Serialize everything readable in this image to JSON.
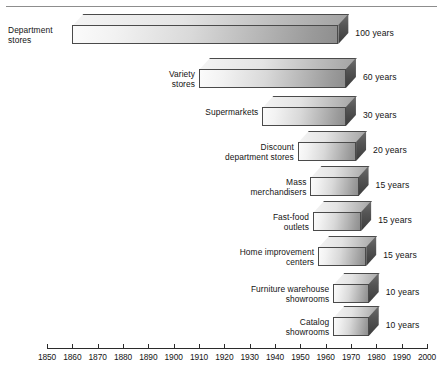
{
  "chart_data": {
    "type": "bar",
    "title": "",
    "subtitle": "",
    "xlabel": "",
    "ylabel": "",
    "orientation": "horizontal",
    "style": "3d-staircase-bars",
    "grid": false,
    "legend": null,
    "xlim": [
      1850,
      2000
    ],
    "axis_ticks": [
      1850,
      1860,
      1870,
      1880,
      1890,
      1900,
      1910,
      1920,
      1930,
      1940,
      1950,
      1960,
      1970,
      1980,
      1990,
      2000
    ],
    "categories": [
      "Department stores",
      "Variety stores",
      "Supermarkets",
      "Discount department stores",
      "Mass merchandisers",
      "Fast-food outlets",
      "Home improvement centers",
      "Furniture warehouse showrooms",
      "Catalog showrooms"
    ],
    "values": [
      100,
      60,
      30,
      20,
      15,
      15,
      15,
      10,
      10
    ],
    "value_unit": "years",
    "value_labels": [
      "100 years",
      "60 years",
      "30 years",
      "15 years",
      "15 years",
      "15 years",
      "15 years",
      "10 years",
      "10 years"
    ],
    "bars": [
      {
        "label": "Department\nstores",
        "value": 100,
        "value_label": "100 years",
        "start_year": 1860,
        "end_year": 1965,
        "label_align": "left"
      },
      {
        "label": "Variety\nstores",
        "value": 60,
        "value_label": "60 years",
        "start_year": 1910,
        "end_year": 1968,
        "label_align": "right"
      },
      {
        "label": "Supermarkets",
        "value": 30,
        "value_label": "30 years",
        "start_year": 1935,
        "end_year": 1968,
        "label_align": "right"
      },
      {
        "label": "Discount\ndepartment stores",
        "value": 20,
        "value_label": "20 years",
        "start_year": 1949,
        "end_year": 1972,
        "label_align": "right"
      },
      {
        "label": "Mass\nmerchandisers",
        "value": 15,
        "value_label": "15 years",
        "start_year": 1954,
        "end_year": 1973,
        "label_align": "right"
      },
      {
        "label": "Fast-food\noutlets",
        "value": 15,
        "value_label": "15 years",
        "start_year": 1955,
        "end_year": 1974,
        "label_align": "right"
      },
      {
        "label": "Home improvement\ncenters",
        "value": 15,
        "value_label": "15 years",
        "start_year": 1957,
        "end_year": 1976,
        "label_align": "right"
      },
      {
        "label": "Furniture warehouse\nshowrooms",
        "value": 10,
        "value_label": "10 years",
        "start_year": 1963,
        "end_year": 1977,
        "label_align": "right"
      },
      {
        "label": "Catalog\nshowrooms",
        "value": 10,
        "value_label": "10 years",
        "start_year": 1963,
        "end_year": 1977,
        "label_align": "right"
      }
    ],
    "colors": {
      "bar_face_light": "#fbfbfb",
      "bar_face_dark": "#8e8e8e",
      "bar_side": "#4a4a4a",
      "bar_outline": "#4a4a4a",
      "axis": "#2b2b2b",
      "text": "#141414",
      "rule": "#8d8d8d",
      "background": "#ffffff"
    }
  }
}
